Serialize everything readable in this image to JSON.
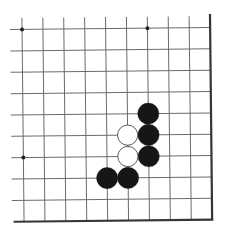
{
  "diagram": {
    "type": "go-board-fragment",
    "visible_columns": 10,
    "visible_rows": 10,
    "board_edges": {
      "top": false,
      "left": false,
      "right": true,
      "bottom": true
    },
    "star_points": [
      {
        "col": 0,
        "row": 0
      },
      {
        "col": 6,
        "row": 0
      },
      {
        "col": 0,
        "row": 6
      }
    ],
    "stones": [
      {
        "color": "black",
        "col": 6,
        "row": 4
      },
      {
        "color": "black",
        "col": 6,
        "row": 5
      },
      {
        "color": "black",
        "col": 6,
        "row": 6
      },
      {
        "color": "white",
        "col": 5,
        "row": 5
      },
      {
        "color": "white",
        "col": 5,
        "row": 6
      },
      {
        "color": "black",
        "col": 4,
        "row": 7
      },
      {
        "color": "black",
        "col": 5,
        "row": 7
      }
    ]
  },
  "colors": {
    "background": "#ffffff",
    "grid_line": "#6b6b6b",
    "edge_line": "#363636",
    "star_point": "#222222",
    "black_stone": "#161616",
    "white_stone": "#ffffff",
    "white_stone_outline": "#4a4a4a"
  }
}
